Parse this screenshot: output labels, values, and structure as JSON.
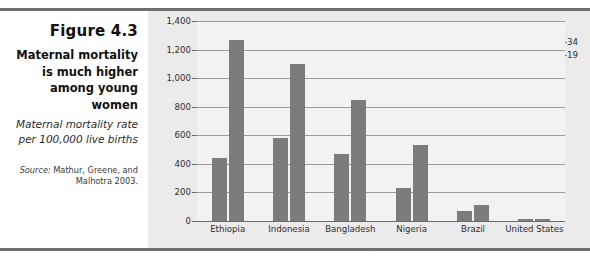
{
  "caption": {
    "figure_number": "Figure 4.3",
    "title": "Maternal mortality is much higher among young women",
    "subtitle": "Maternal mortality rate per 100,000 live births",
    "source_lead": "Source:",
    "source_text": " Mathur, Greene, and Malhotra 2003."
  },
  "legend": {
    "items": [
      {
        "label": "Ages 20–34",
        "color": "#7c7c7c"
      },
      {
        "label": "Ages 15–19",
        "color": "#7c7c7c"
      }
    ]
  },
  "axis": {
    "y_ticks": [
      "1,400",
      "1,200",
      "1,000",
      "800",
      "600",
      "400",
      "200",
      "0"
    ]
  },
  "colors": {
    "panel_background": "#ebebeb",
    "plot_background": "#f2f2f2",
    "bar": "#7c7c7c",
    "rule": "#6f6f6f",
    "gridline": "#9a9a9a"
  },
  "chart_data": {
    "type": "bar",
    "title": "Maternal mortality is much higher among young women",
    "subtitle": "Maternal mortality rate per 100,000 live births",
    "xlabel": "",
    "ylabel": "Maternal mortality rate per 100,000 live births",
    "ylim": [
      0,
      1400
    ],
    "ytick_step": 200,
    "grid": true,
    "legend_position": "top-right",
    "categories": [
      "Ethiopia",
      "Indonesia",
      "Bangladesh",
      "Nigeria",
      "Brazil",
      "United States"
    ],
    "series": [
      {
        "name": "Ages 20–34",
        "values": [
          440,
          580,
          470,
          230,
          70,
          12
        ]
      },
      {
        "name": "Ages 15–19",
        "values": [
          1270,
          1100,
          850,
          530,
          110,
          15
        ]
      }
    ],
    "source": "Mathur, Greene, and Malhotra 2003."
  }
}
